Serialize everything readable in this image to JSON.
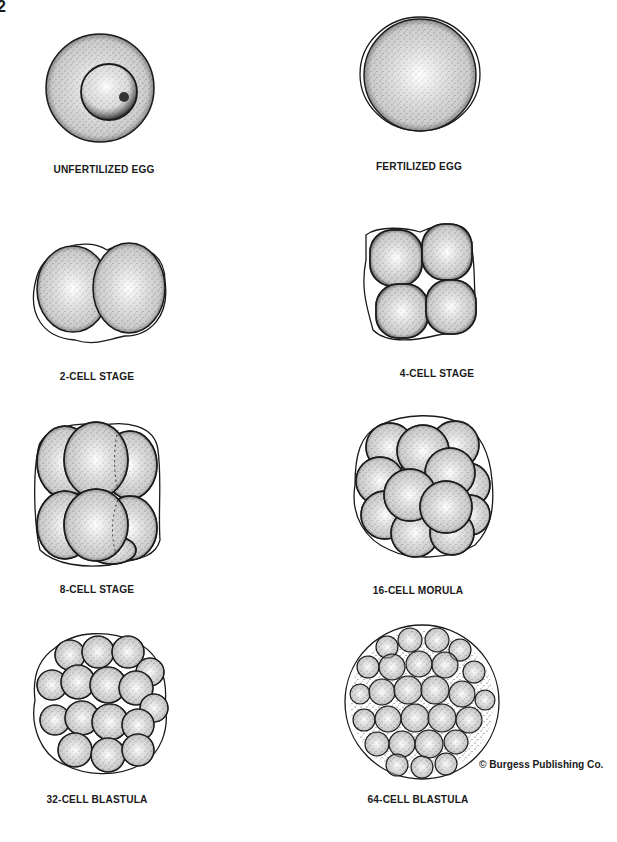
{
  "page_number": "2",
  "stages": [
    {
      "id": "unfertilized-egg",
      "label": "UNFERTILIZED EGG",
      "cells": 0
    },
    {
      "id": "fertilized-egg",
      "label": "FERTILIZED EGG",
      "cells": 1
    },
    {
      "id": "2-cell-stage",
      "label": "2-CELL STAGE",
      "cells": 2
    },
    {
      "id": "4-cell-stage",
      "label": "4-CELL STAGE",
      "cells": 4
    },
    {
      "id": "8-cell-stage",
      "label": "8-CELL STAGE",
      "cells": 8
    },
    {
      "id": "16-cell-morula",
      "label": "16-CELL MORULA",
      "cells": 16
    },
    {
      "id": "32-cell-blastula",
      "label": "32-CELL BLASTULA",
      "cells": 32
    },
    {
      "id": "64-cell-blastula",
      "label": "64-CELL BLASTULA",
      "cells": 64
    }
  ],
  "copyright": "© Burgess Publishing Co.",
  "colors": {
    "ink": "#1a1a1a",
    "background": "#ffffff"
  }
}
